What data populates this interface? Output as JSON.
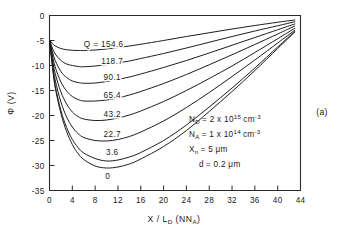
{
  "chart_data": {
    "type": "line",
    "title": "",
    "xlabel": "X / L_D (N_A)",
    "ylabel": "Φ (V)",
    "xlim": [
      0,
      44
    ],
    "ylim": [
      -35,
      0
    ],
    "grid": false,
    "legend_position": "inline-curve-labels",
    "xticks": [
      0,
      4,
      8,
      12,
      16,
      20,
      24,
      28,
      32,
      36,
      40,
      44
    ],
    "xtick_labels": [
      "0",
      "4",
      "8",
      "12",
      "16",
      "20",
      "24",
      "28",
      "32",
      "36",
      "40",
      "44"
    ],
    "yticks": [
      0,
      -5,
      -10,
      -15,
      -20,
      -25,
      -30,
      -35
    ],
    "ytick_labels": [
      "0",
      "-5",
      "-10",
      "-15",
      "-20",
      "-25",
      "-30",
      "-35"
    ],
    "series_parameter_name": "Q",
    "series": [
      {
        "name": "154.6",
        "label": "Q = 154.6",
        "x": [
          0,
          0.5,
          1,
          2,
          3,
          4,
          5,
          6,
          8,
          10,
          12,
          14,
          16,
          20,
          24,
          28,
          32,
          36,
          40,
          43
        ],
        "values": [
          -4.8,
          -5.6,
          -6.1,
          -6.6,
          -6.85,
          -6.95,
          -7.0,
          -7.0,
          -6.9,
          -6.7,
          -6.4,
          -6.1,
          -5.75,
          -5.0,
          -4.2,
          -3.45,
          -2.7,
          -2.0,
          -1.35,
          -0.9
        ]
      },
      {
        "name": "118.7",
        "label": "118.7",
        "x": [
          0,
          0.5,
          1,
          2,
          3,
          4,
          5,
          6,
          8,
          10,
          12,
          14,
          16,
          20,
          24,
          28,
          32,
          36,
          40,
          43
        ],
        "values": [
          -4.8,
          -6.5,
          -7.7,
          -9.0,
          -9.7,
          -10.0,
          -10.2,
          -10.25,
          -10.1,
          -9.85,
          -9.5,
          -9.1,
          -8.6,
          -7.6,
          -6.5,
          -5.35,
          -4.2,
          -3.1,
          -2.05,
          -1.25
        ]
      },
      {
        "name": "90.1",
        "label": "90.1",
        "x": [
          0,
          0.5,
          1,
          2,
          3,
          4,
          5,
          6,
          8,
          10,
          12,
          14,
          16,
          20,
          24,
          28,
          32,
          36,
          40,
          43
        ],
        "values": [
          -4.8,
          -7.2,
          -9.0,
          -11.2,
          -12.4,
          -13.1,
          -13.4,
          -13.55,
          -13.5,
          -13.2,
          -12.8,
          -12.3,
          -11.7,
          -10.4,
          -9.0,
          -7.5,
          -5.95,
          -4.4,
          -2.85,
          -1.7
        ]
      },
      {
        "name": "65.4",
        "label": "65.4",
        "x": [
          0,
          0.5,
          1,
          2,
          3,
          4,
          5,
          6,
          8,
          10,
          12,
          14,
          16,
          20,
          24,
          28,
          32,
          36,
          40,
          43
        ],
        "values": [
          -4.8,
          -7.9,
          -10.3,
          -13.3,
          -15.1,
          -16.2,
          -16.8,
          -17.1,
          -17.1,
          -16.9,
          -16.5,
          -15.9,
          -15.2,
          -13.6,
          -11.8,
          -9.85,
          -7.85,
          -5.8,
          -3.7,
          -2.1
        ]
      },
      {
        "name": "43.2",
        "label": "43.2",
        "x": [
          0,
          0.5,
          1,
          2,
          3,
          4,
          5,
          6,
          8,
          10,
          12,
          14,
          16,
          20,
          24,
          28,
          32,
          36,
          40,
          43
        ],
        "values": [
          -4.8,
          -8.6,
          -11.6,
          -15.3,
          -17.7,
          -19.3,
          -20.2,
          -20.7,
          -21.0,
          -20.9,
          -20.5,
          -19.9,
          -19.1,
          -17.2,
          -15.0,
          -12.6,
          -10.1,
          -7.4,
          -4.65,
          -2.55
        ]
      },
      {
        "name": "22.7",
        "label": "22.7",
        "x": [
          0,
          0.5,
          1,
          2,
          3,
          4,
          5,
          6,
          8,
          10,
          12,
          14,
          16,
          20,
          24,
          28,
          32,
          36,
          40,
          43
        ],
        "values": [
          -4.8,
          -9.3,
          -12.9,
          -17.3,
          -20.3,
          -22.3,
          -23.6,
          -24.4,
          -25.0,
          -25.1,
          -24.8,
          -24.2,
          -23.3,
          -21.1,
          -18.4,
          -15.4,
          -12.2,
          -8.9,
          -5.5,
          -2.95
        ]
      },
      {
        "name": "3.6",
        "label": "3.6",
        "x": [
          0,
          0.5,
          1,
          2,
          3,
          4,
          5,
          6,
          8,
          10,
          12,
          14,
          16,
          20,
          24,
          28,
          32,
          36,
          40,
          43
        ],
        "values": [
          -4.8,
          -9.9,
          -14.0,
          -19.0,
          -22.4,
          -24.8,
          -26.4,
          -27.5,
          -28.6,
          -29.1,
          -28.9,
          -28.3,
          -27.4,
          -25.0,
          -21.9,
          -18.3,
          -14.5,
          -10.5,
          -6.3,
          -3.2
        ]
      },
      {
        "name": "0",
        "label": "0",
        "x": [
          0,
          0.5,
          1,
          2,
          3,
          4,
          5,
          6,
          8,
          10,
          12,
          14,
          16,
          20,
          24,
          28,
          32,
          36,
          40,
          43
        ],
        "values": [
          -4.8,
          -10.1,
          -14.4,
          -19.6,
          -23.2,
          -25.8,
          -27.6,
          -28.8,
          -30.1,
          -30.5,
          -30.3,
          -29.7,
          -28.7,
          -26.2,
          -23.0,
          -19.2,
          -15.2,
          -11.0,
          -6.6,
          -3.3
        ]
      }
    ],
    "curve_label_positions": [
      {
        "label": "Q = 154.6",
        "x": 9.5,
        "y": -6.3
      },
      {
        "label": "118.7",
        "x": 11.0,
        "y": -9.6
      },
      {
        "label": "90.1",
        "x": 11.0,
        "y": -12.9
      },
      {
        "label": "65.4",
        "x": 11.0,
        "y": -16.5
      },
      {
        "label": "43.2",
        "x": 11.0,
        "y": -20.3
      },
      {
        "label": "22.7",
        "x": 11.0,
        "y": -24.2
      },
      {
        "label": "3.6",
        "x": 11.0,
        "y": -27.8
      },
      {
        "label": "0",
        "x": 10.2,
        "y": -32.6
      }
    ],
    "annotations": [
      {
        "id": "nd",
        "text": "N_D = 2 x 10^15 cm^-3"
      },
      {
        "id": "na",
        "text": "N_A = 1 x 10^14 cm^-3"
      },
      {
        "id": "xn",
        "text": "X_n = 5 μm"
      },
      {
        "id": "d",
        "text": "d = 0.2 μm"
      }
    ],
    "panel_label": "(a)"
  },
  "axes": {
    "y_label_main": "Φ",
    "y_label_units": "(V)",
    "x_label_main": "X / L",
    "x_label_sub1": "D",
    "x_label_paren_open": " (N",
    "x_label_sub2": "A",
    "x_label_paren_close": ")"
  },
  "annotation_parts": {
    "nd_symbol": "N",
    "nd_sub": "D",
    "nd_eq": "= 2 x 10",
    "nd_exp": "15",
    "nd_unit": "cm",
    "nd_unit_exp": "-3",
    "na_symbol": "N",
    "na_sub": "A",
    "na_eq": "= 1 x 10",
    "na_exp": "14",
    "na_unit": "cm",
    "na_unit_exp": "-3",
    "xn_symbol": "X",
    "xn_sub": "n",
    "xn_value": "= 5 μm",
    "d_symbol": "d",
    "d_value": "= 0.2 μm"
  },
  "panel": {
    "label": "(a)"
  },
  "colors": {
    "curve": "#1d1d1d",
    "axis": "#2b2b2b",
    "text": "#1a1a1a",
    "background": "#ffffff"
  }
}
